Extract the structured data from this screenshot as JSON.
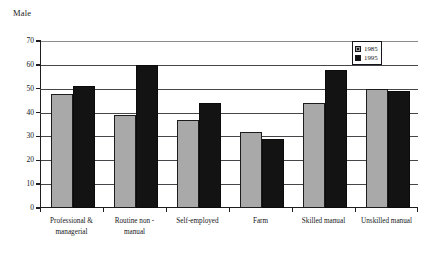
{
  "chart_data": {
    "type": "bar",
    "title": "Male",
    "xlabel": "",
    "ylabel": "",
    "ylim": [
      0,
      70
    ],
    "yticks": [
      0,
      10,
      20,
      30,
      40,
      50,
      60,
      70
    ],
    "grid": true,
    "legend_position": "top-right",
    "categories": [
      "Professional & managerial",
      "Routine non - manual",
      "Self-employed",
      "Farm",
      "Skilled manual",
      "Unskilled manual"
    ],
    "category_lines": [
      [
        "Professional &",
        "managerial"
      ],
      [
        "Routine non  -",
        "manual"
      ],
      [
        "Self-employed",
        ""
      ],
      [
        "Farm",
        ""
      ],
      [
        "Skilled manual",
        ""
      ],
      [
        "Unskilled manual",
        ""
      ]
    ],
    "series": [
      {
        "name": "1985",
        "color": "#a9a9a9",
        "values": [
          48,
          39,
          37,
          32,
          44,
          50
        ]
      },
      {
        "name": "1995",
        "color": "#131313",
        "values": [
          51,
          60,
          44,
          29,
          58,
          49
        ]
      }
    ]
  },
  "legend": {
    "items": [
      {
        "label": "1985"
      },
      {
        "label": "1995"
      }
    ]
  }
}
